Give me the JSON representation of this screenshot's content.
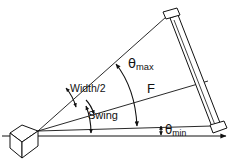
{
  "figure": {
    "background_color": "#ffffff",
    "stroke_color": "#111111",
    "width": 233,
    "height": 164
  },
  "labels": {
    "theta_max": "θmax",
    "theta_max_base": "θ",
    "theta_max_sub": "max",
    "width_half": "Width/2",
    "swing": "Swing",
    "focal": "F",
    "theta_min": "θmin",
    "theta_min_base": "θ",
    "theta_min_sub": "min"
  },
  "elements": {
    "sensor": "isometric-cube-sensor",
    "target": "tilted-rectangular-bar",
    "axis": "horizontal-reference-axis-with-arrow",
    "rays": [
      "upper-field-of-view-ray",
      "center-focal-ray",
      "lower-field-of-view-ray",
      "horizontal-baseline"
    ],
    "arcs": [
      "theta-max-arc-double-arrow",
      "width-half-arc-double-arrow",
      "swing-arc-double-arrow",
      "theta-min-arrow-double"
    ]
  },
  "geometry": {
    "apex_x": 38,
    "apex_y": 131,
    "bar_top": [
      168,
      13
    ],
    "bar_bottom": [
      214,
      131
    ],
    "axis_y": 136,
    "axis_end_x": 228
  }
}
